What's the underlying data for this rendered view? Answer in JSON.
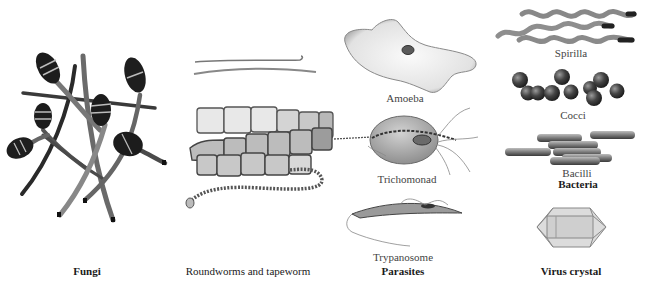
{
  "figure": {
    "panels": [
      {
        "id": "fungi",
        "group_label": "Fungi",
        "items": []
      },
      {
        "id": "worms",
        "group_label": "Roundworms and tapeworm",
        "items": []
      },
      {
        "id": "parasites",
        "group_label": "Parasites",
        "items": [
          {
            "label": "Amoeba"
          },
          {
            "label": "Trichomonad"
          },
          {
            "label": "Trypanosome"
          }
        ]
      },
      {
        "id": "bacteria",
        "group_label": "Bacteria",
        "items": [
          {
            "label": "Spirilla"
          },
          {
            "label": "Cocci"
          },
          {
            "label": "Bacilli"
          }
        ]
      },
      {
        "id": "virus",
        "group_label": "Virus crystal",
        "items": []
      }
    ],
    "colors": {
      "background": "#ffffff",
      "fungi_dark": "#1c1c1c",
      "fungi_stalk": "#6e6e6e",
      "worm_fill": "#c8c8c8",
      "worm_stroke": "#555555",
      "parasite_fill": "#e6e6e6",
      "bacteria_fill": "#8a8a8a",
      "cocci_fill": "#3a3a3a",
      "crystal_fill": "#d8d8d8"
    }
  }
}
